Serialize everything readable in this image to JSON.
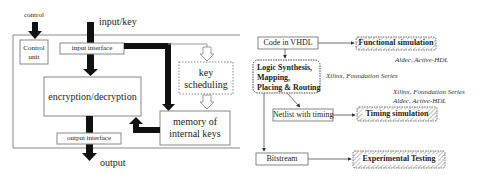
{
  "left_diagram": {
    "control_label": "control",
    "input_key_label": "input/key",
    "output_label": "output",
    "control_unit": [
      "Control",
      "unit"
    ],
    "input_interface": "input interface",
    "encryption_decryption": "encryption/decryption",
    "key_scheduling": [
      "key",
      "scheduling"
    ],
    "memory_of_internal_keys": [
      "memory of",
      "internal keys"
    ],
    "output_interface": "output interface"
  },
  "right_diagram": {
    "code_in_vhdl": "Code in VHDL",
    "functional_simulation": "Functional simulation",
    "aldec_tool_1": "Aldec, Active-HDL",
    "logic_synthesis": [
      "Logic Synthesis,",
      "Mapping,",
      "Placing & Routing"
    ],
    "xilinx_tool_1": "Xilinx, Foundation Series",
    "xilinx_tool_2": "Xilinx, Foundation Series",
    "aldec_tool_2": "Aldec, Active-HDL",
    "netlist_with_timing": "Netlist with timing",
    "timing_simulation": "Timing simulation",
    "bitstream": "Bitstream",
    "experimental_testing": "Experimental Testing"
  },
  "colors": {
    "line": "#333333",
    "thick_arrow": "#111111",
    "box_border": "#777777",
    "hatch": "#888888"
  }
}
